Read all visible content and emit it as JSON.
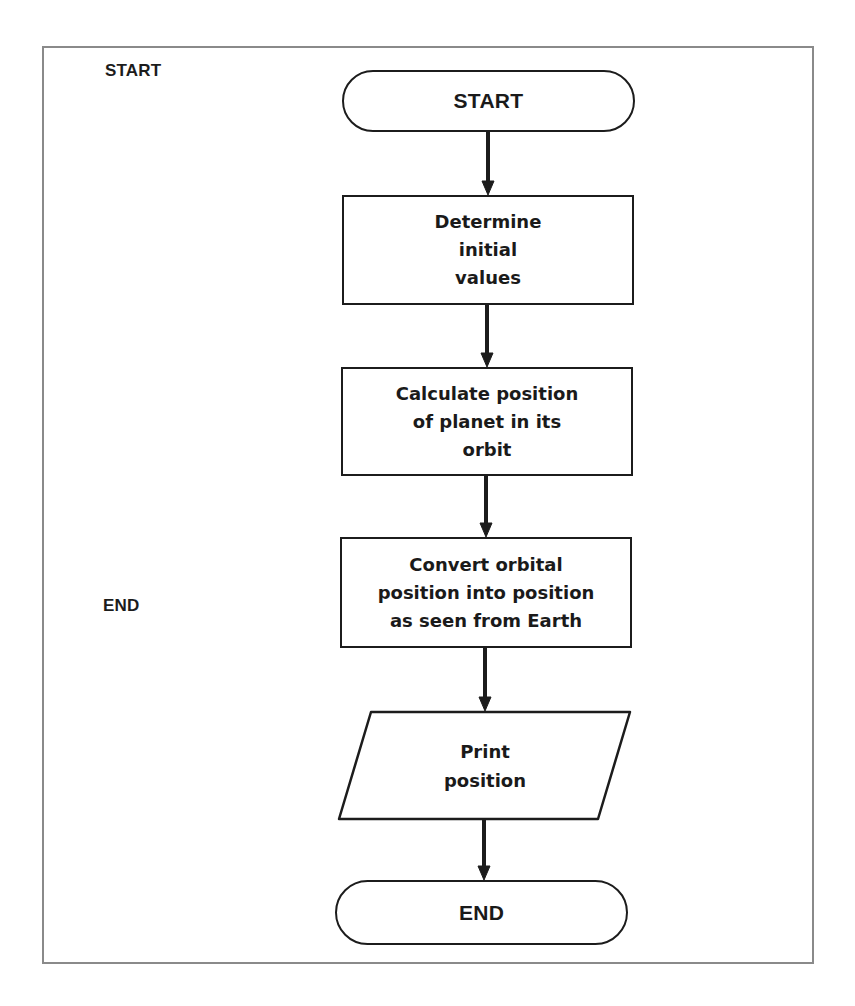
{
  "legend": {
    "start_label": "START",
    "end_label": "END"
  },
  "flowchart": {
    "nodes": [
      {
        "id": "start",
        "shape": "terminal",
        "text": "START"
      },
      {
        "id": "step1",
        "shape": "process",
        "text": "Determine\ninitial\nvalues"
      },
      {
        "id": "step2",
        "shape": "process",
        "text": "Calculate position\nof planet in its\norbit"
      },
      {
        "id": "step3",
        "shape": "process",
        "text": "Convert orbital\nposition into position\nas seen from Earth"
      },
      {
        "id": "output",
        "shape": "input-output",
        "text": "Print\nposition"
      },
      {
        "id": "end",
        "shape": "terminal",
        "text": "END"
      }
    ],
    "edges": [
      {
        "from": "start",
        "to": "step1"
      },
      {
        "from": "step1",
        "to": "step2"
      },
      {
        "from": "step2",
        "to": "step3"
      },
      {
        "from": "step3",
        "to": "output"
      },
      {
        "from": "output",
        "to": "end"
      }
    ]
  },
  "colors": {
    "ink": "#1c1c1c",
    "frame": "#8a8a8a",
    "background": "#ffffff"
  }
}
